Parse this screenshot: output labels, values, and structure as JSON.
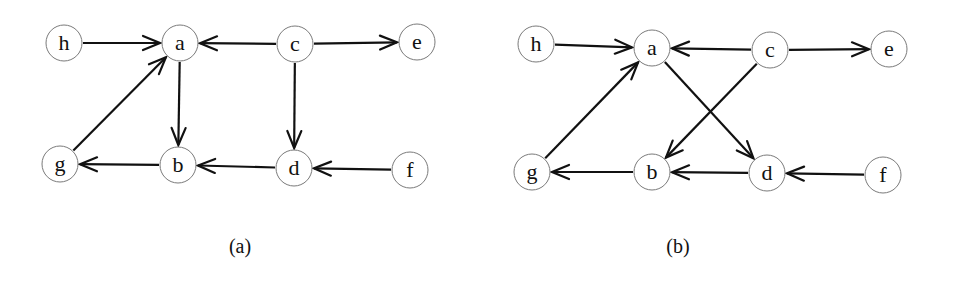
{
  "figure": {
    "node_radius": 18,
    "colors": {
      "edge": "#111111",
      "node_stroke": "#7a7a7a",
      "node_fill": "#ffffff"
    },
    "panels": [
      {
        "caption": "(a)",
        "caption_pos": [
          240,
          253
        ],
        "nodes": [
          {
            "id": "h",
            "label": "h",
            "x": 64,
            "y": 43
          },
          {
            "id": "a",
            "label": "a",
            "x": 180,
            "y": 43
          },
          {
            "id": "c",
            "label": "c",
            "x": 295,
            "y": 44
          },
          {
            "id": "e",
            "label": "e",
            "x": 417,
            "y": 42
          },
          {
            "id": "g",
            "label": "g",
            "x": 60,
            "y": 164
          },
          {
            "id": "b",
            "label": "b",
            "x": 178,
            "y": 165
          },
          {
            "id": "d",
            "label": "d",
            "x": 294,
            "y": 168
          },
          {
            "id": "f",
            "label": "f",
            "x": 410,
            "y": 170
          }
        ],
        "edges": [
          {
            "from": "h",
            "to": "a"
          },
          {
            "from": "c",
            "to": "a"
          },
          {
            "from": "c",
            "to": "e"
          },
          {
            "from": "g",
            "to": "a"
          },
          {
            "from": "a",
            "to": "b"
          },
          {
            "from": "c",
            "to": "d"
          },
          {
            "from": "b",
            "to": "g"
          },
          {
            "from": "d",
            "to": "b"
          },
          {
            "from": "f",
            "to": "d"
          }
        ]
      },
      {
        "caption": "(b)",
        "caption_pos": [
          678,
          253
        ],
        "nodes": [
          {
            "id": "h",
            "label": "h",
            "x": 536,
            "y": 44
          },
          {
            "id": "a",
            "label": "a",
            "x": 652,
            "y": 48
          },
          {
            "id": "c",
            "label": "c",
            "x": 770,
            "y": 50
          },
          {
            "id": "e",
            "label": "e",
            "x": 889,
            "y": 49
          },
          {
            "id": "g",
            "label": "g",
            "x": 532,
            "y": 172
          },
          {
            "id": "b",
            "label": "b",
            "x": 652,
            "y": 172
          },
          {
            "id": "d",
            "label": "d",
            "x": 767,
            "y": 173
          },
          {
            "id": "f",
            "label": "f",
            "x": 883,
            "y": 175
          }
        ],
        "edges": [
          {
            "from": "h",
            "to": "a"
          },
          {
            "from": "c",
            "to": "a"
          },
          {
            "from": "c",
            "to": "e"
          },
          {
            "from": "g",
            "to": "a"
          },
          {
            "from": "a",
            "to": "d"
          },
          {
            "from": "c",
            "to": "b"
          },
          {
            "from": "b",
            "to": "g"
          },
          {
            "from": "d",
            "to": "b"
          },
          {
            "from": "f",
            "to": "d"
          }
        ]
      }
    ]
  }
}
